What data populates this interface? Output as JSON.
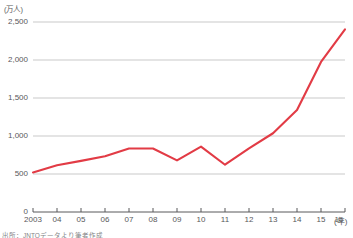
{
  "chart_data": {
    "type": "line",
    "title": "",
    "subtitle": "",
    "xlabel": "(年)",
    "ylabel": "(万人)",
    "unit_label": "(万人)",
    "x_unit_label": "(年)",
    "categories": [
      "2003",
      "04",
      "05",
      "06",
      "07",
      "08",
      "09",
      "10",
      "11",
      "12",
      "13",
      "14",
      "15",
      "16"
    ],
    "x_values": [
      2003,
      2004,
      2005,
      2006,
      2007,
      2008,
      2009,
      2010,
      2011,
      2012,
      2013,
      2014,
      2015,
      2016
    ],
    "values": [
      521,
      614,
      673,
      733,
      835,
      835,
      679,
      861,
      622,
      836,
      1036,
      1341,
      1974,
      2404
    ],
    "series": [
      {
        "name": "訪日外客数",
        "color": "#E23B45",
        "values": [
          521,
          614,
          673,
          733,
          835,
          835,
          679,
          861,
          622,
          836,
          1036,
          1341,
          1974,
          2404
        ]
      }
    ],
    "ylim": [
      0,
      2500
    ],
    "xlim": [
      2003,
      2016
    ],
    "y_ticks": [
      0,
      500,
      1000,
      1500,
      2000,
      2500
    ],
    "y_tick_labels": [
      "0",
      "500",
      "1,000",
      "1,500",
      "2,000",
      "2,500"
    ],
    "x_tick_labels": [
      "2003",
      "04",
      "05",
      "06",
      "07",
      "08",
      "09",
      "10",
      "11",
      "12",
      "13",
      "14",
      "15",
      "16"
    ],
    "grid": true,
    "grid_color": "#c9c9c9",
    "legend": false,
    "legend_position": "none",
    "line_color": "#E23B45",
    "line_width": 2.1,
    "markers": false,
    "axis_color": "#58585a",
    "background": "#ffffff"
  },
  "source": {
    "note": "出所：JNTOデータより筆者作成"
  }
}
